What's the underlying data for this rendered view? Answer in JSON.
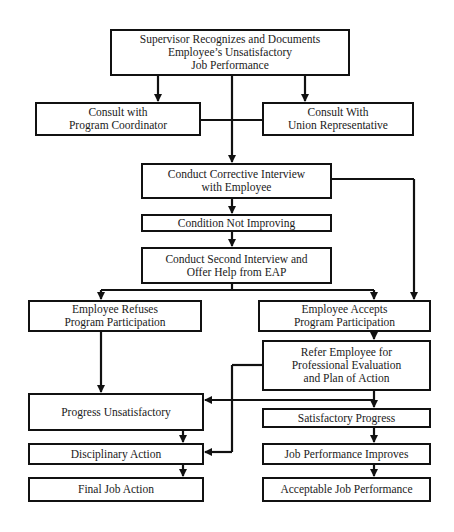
{
  "diagram": {
    "type": "flowchart",
    "nodes": [
      {
        "id": "supervisor",
        "lines": [
          "Supervisor Recognizes and Documents",
          "Employee’s Unsatisfactory",
          "Job Performance"
        ]
      },
      {
        "id": "consult_coordinator",
        "lines": [
          "Consult with",
          "Program Coordinator"
        ]
      },
      {
        "id": "consult_union",
        "lines": [
          "Consult With",
          "Union Representative"
        ]
      },
      {
        "id": "corrective_interview",
        "lines": [
          "Conduct Corrective Interview",
          "with Employee"
        ]
      },
      {
        "id": "not_improving",
        "lines": [
          "Condition Not Improving"
        ]
      },
      {
        "id": "second_interview",
        "lines": [
          "Conduct Second Interview and",
          "Offer Help from EAP"
        ]
      },
      {
        "id": "refuses",
        "lines": [
          "Employee Refuses",
          "Program Participation"
        ]
      },
      {
        "id": "accepts",
        "lines": [
          "Employee Accepts",
          "Program Participation"
        ]
      },
      {
        "id": "refer",
        "lines": [
          "Refer Employee for",
          "Professional Evaluation",
          "and Plan of Action"
        ]
      },
      {
        "id": "progress_unsat",
        "lines": [
          "Progress Unsatisfactory"
        ]
      },
      {
        "id": "sat_progress",
        "lines": [
          "Satisfactory Progress"
        ]
      },
      {
        "id": "disciplinary",
        "lines": [
          "Disciplinary Action"
        ]
      },
      {
        "id": "job_improves",
        "lines": [
          "Job Performance Improves"
        ]
      },
      {
        "id": "final_action",
        "lines": [
          "Final Job Action"
        ]
      },
      {
        "id": "acceptable",
        "lines": [
          "Acceptable Job Performance"
        ]
      }
    ],
    "edges": [
      [
        "supervisor",
        "consult_coordinator"
      ],
      [
        "supervisor",
        "consult_union"
      ],
      [
        "supervisor",
        "corrective_interview"
      ],
      [
        "consult_coordinator",
        "corrective_interview"
      ],
      [
        "consult_union",
        "corrective_interview"
      ],
      [
        "corrective_interview",
        "not_improving"
      ],
      [
        "corrective_interview",
        "accepts"
      ],
      [
        "not_improving",
        "second_interview"
      ],
      [
        "second_interview",
        "refuses"
      ],
      [
        "second_interview",
        "accepts"
      ],
      [
        "accepts",
        "refer"
      ],
      [
        "refer",
        "sat_progress"
      ],
      [
        "refer",
        "progress_unsat"
      ],
      [
        "refer",
        "disciplinary"
      ],
      [
        "refuses",
        "progress_unsat"
      ],
      [
        "progress_unsat",
        "disciplinary"
      ],
      [
        "disciplinary",
        "final_action"
      ],
      [
        "sat_progress",
        "job_improves"
      ],
      [
        "job_improves",
        "acceptable"
      ]
    ]
  }
}
